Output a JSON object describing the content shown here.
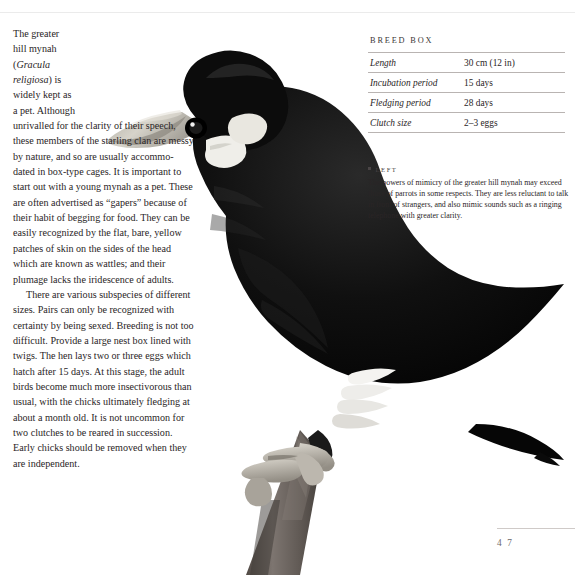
{
  "page": {
    "folio": "4 7"
  },
  "article": {
    "paragraphs": [
      "The greater hill mynah (Gracula religiosa) is widely kept as a pet. Although unrivalled for the clarity of their speech, these members of the starling clan are messy by nature, and so are usually accommo-dated in box-type cages. It is important to start out with a young mynah as a pet. These are often advertised as “gapers” because of their habit of begging for food. They can be easily recognized by the flat, bare, yellow patches of skin on the sides of the head which are known as wattles; and their plumage lacks the iridescence of adults.",
      "There are various subspecies of different sizes. Pairs can only be recognized with certainty by being sexed. Breeding is not too difficult. Provide a large nest box lined with twigs. The hen lays two or three eggs which hatch after 15 days. At this stage, the adult birds become much more insectivorous than usual, with the chicks ultimately fledging at about a month old. It is not uncommon for two clutches to be reared in succession. Early chicks should be removed when they are independent."
    ],
    "paragraph_1_parts": {
      "before_italic": "The greater hill mynah (",
      "italic": "Gracula religiosa",
      "after_italic": ") is widely kept as a pet. Although unrivalled for the clarity of their speech, these members of the starling clan are messy by nature, and so are usually accommo-dated in box-type cages. It is important to start out with a young mynah as a pet. These are often advertised as “gapers” because of their habit of begging for food. They can be easily recognized by the flat, bare, yellow patches of skin on the sides of the head which are known as wattles; and their plumage lacks the iridescence of adults."
    }
  },
  "breed_box": {
    "title": "BREED BOX",
    "rows": [
      {
        "label": "Length",
        "value": "30 cm (12 in)"
      },
      {
        "label": "Incubation period",
        "value": "15 days"
      },
      {
        "label": "Fledging period",
        "value": "28 days"
      },
      {
        "label": "Clutch size",
        "value": "2–3 eggs"
      }
    ]
  },
  "caption": {
    "heading": "LEFT",
    "body": "The powers of mimicry of the greater hill mynah may exceed those of parrots in some respects. They are less reluctant to talk in front of strangers, and also mimic sounds such as a ringing telephone with greater clarity."
  },
  "photo": {
    "subject": "greater-hill-mynah-on-branch",
    "colors": {
      "plumage": "#080808",
      "beak": "#c9c6bd",
      "wattle": "#efeee9",
      "branch": "#6e6660",
      "feet": "#b5b0a7",
      "background": "#ffffff"
    }
  }
}
